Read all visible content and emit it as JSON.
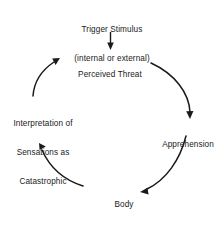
{
  "diagram": {
    "background_color": "#ffffff",
    "stroke_color": "#1a1a1a",
    "text_color": "#1a1a1a",
    "nodes": [
      {
        "id": "trigger-stimulus",
        "lines": [
          "Trigger Stimulus",
          "(internal or external)"
        ],
        "line1": "Trigger Stimulus",
        "line2": "(internal or external)"
      },
      {
        "id": "perceived-threat",
        "lines": [
          "Perceived Threat"
        ],
        "line1": "Perceived Threat",
        "line2": ""
      },
      {
        "id": "apprehension",
        "lines": [
          "Apprehension"
        ],
        "line1": "Apprehension",
        "line2": ""
      },
      {
        "id": "body-sensations",
        "lines": [
          "Body",
          "Sensations"
        ],
        "line1": "Body",
        "line2": "Sensations"
      },
      {
        "id": "interpretation-of-sensations-as-catastrophic",
        "lines": [
          "Interpretation of",
          "Sensations as",
          "Catastrophic"
        ],
        "line1": "Interpretation of",
        "line2": "Sensations as",
        "line3": "Catastrophic"
      }
    ],
    "connectors": [
      {
        "id": "trigger-to-perceived-threat",
        "from": "trigger-stimulus",
        "to": "perceived-threat",
        "shape": "straight-arrow",
        "direction": "down"
      },
      {
        "id": "perceived-threat-to-apprehension",
        "from": "perceived-threat",
        "to": "apprehension",
        "shape": "curved-arrow",
        "direction": "clockwise-right"
      },
      {
        "id": "apprehension-to-body-sensations",
        "from": "apprehension",
        "to": "body-sensations",
        "shape": "curved-arrow",
        "direction": "clockwise-bottom"
      },
      {
        "id": "body-sensations-to-interpretation",
        "from": "body-sensations",
        "to": "interpretation-of-sensations-as-catastrophic",
        "shape": "curved-arrow",
        "direction": "clockwise-left"
      },
      {
        "id": "interpretation-to-perceived-threat",
        "from": "interpretation-of-sensations-as-catastrophic",
        "to": "perceived-threat",
        "shape": "curved-arrow",
        "direction": "clockwise-top"
      }
    ]
  }
}
